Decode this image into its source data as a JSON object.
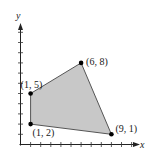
{
  "chart_data": {
    "type": "scatter",
    "title": "",
    "xlabel": "x",
    "ylabel": "y",
    "xlim": [
      0,
      11
    ],
    "ylim": [
      0,
      11
    ],
    "grid": false,
    "legend": null,
    "shaded_region": {
      "shape": "polygon",
      "vertices": [
        [
          1,
          2
        ],
        [
          1,
          5
        ],
        [
          6,
          8
        ],
        [
          9,
          1
        ]
      ],
      "fill": "#c8c8c8",
      "edge": "#555555"
    },
    "points": [
      {
        "x": 1,
        "y": 2,
        "label": "(1, 2)"
      },
      {
        "x": 1,
        "y": 5,
        "label": "(1, 5)"
      },
      {
        "x": 6,
        "y": 8,
        "label": "(6, 8)"
      },
      {
        "x": 9,
        "y": 1,
        "label": "(9, 1)"
      }
    ],
    "x_ticks": [
      1,
      2,
      3,
      4,
      5,
      6,
      7,
      8,
      9,
      10,
      11
    ],
    "y_ticks": [
      1,
      2,
      3,
      4,
      5,
      6,
      7,
      8,
      9,
      10,
      11
    ]
  }
}
